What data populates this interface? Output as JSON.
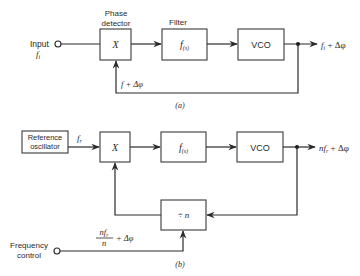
{
  "diagram_a": {
    "input_label": "Input",
    "input_symbol": "f",
    "input_subscript": "i",
    "phase_detector_label_line1": "Phase",
    "phase_detector_label_line2": "detector",
    "phase_detector_symbol": "X",
    "filter_label": "Filter",
    "filter_symbol": "f",
    "filter_subscript": "(s)",
    "vco_label": "VCO",
    "output_symbol": "f",
    "output_subscript": "i",
    "output_suffix": " + Δφ",
    "feedback_label": "f  + Δφ",
    "caption": "(a)"
  },
  "diagram_b": {
    "reference_label_line1": "Reference",
    "reference_label_line2": "oscillator",
    "reference_out_symbol": "f",
    "reference_out_subscript": "r",
    "mixer_symbol": "X",
    "filter_symbol": "f",
    "filter_subscript": "(s)",
    "vco_label": "VCO",
    "output_prefix": "nf",
    "output_subscript": "r",
    "output_suffix": " + Δφ",
    "divider_label": "÷ n",
    "freq_control_line1": "Frequency",
    "freq_control_line2": "control",
    "fraction_numerator": "nf",
    "fraction_numerator_sub": "r",
    "fraction_denominator": "n",
    "fraction_suffix": "+ Δφ",
    "caption": "(b)"
  }
}
